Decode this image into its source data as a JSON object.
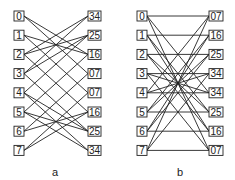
{
  "diagrams": [
    {
      "id": "a",
      "caption": "a",
      "left_labels": [
        "0",
        "1",
        "2",
        "3",
        "4",
        "5",
        "6",
        "7"
      ],
      "right_labels": [
        "34",
        "25",
        "16",
        "07",
        "07",
        "16",
        "25",
        "34"
      ],
      "connections": [
        [
          0,
          2
        ],
        [
          0,
          3
        ],
        [
          1,
          2
        ],
        [
          1,
          4
        ],
        [
          2,
          0
        ],
        [
          2,
          1
        ],
        [
          2,
          5
        ],
        [
          3,
          0
        ],
        [
          3,
          1
        ],
        [
          3,
          6
        ],
        [
          4,
          6
        ],
        [
          4,
          7
        ],
        [
          4,
          1
        ],
        [
          5,
          6
        ],
        [
          5,
          7
        ],
        [
          5,
          2
        ],
        [
          6,
          3
        ],
        [
          6,
          5
        ],
        [
          7,
          5
        ],
        [
          7,
          4
        ]
      ]
    },
    {
      "id": "b",
      "caption": "b",
      "left_labels": [
        "0",
        "1",
        "2",
        "3",
        "4",
        "5",
        "6",
        "7"
      ],
      "right_labels": [
        "07",
        "16",
        "25",
        "34",
        "34",
        "25",
        "16",
        "07"
      ],
      "connections": [
        [
          0,
          0
        ],
        [
          1,
          1
        ],
        [
          2,
          2
        ],
        [
          3,
          3
        ],
        [
          4,
          4
        ],
        [
          5,
          5
        ],
        [
          6,
          6
        ],
        [
          7,
          7
        ],
        [
          0,
          7
        ],
        [
          1,
          6
        ],
        [
          2,
          5
        ],
        [
          3,
          4
        ],
        [
          4,
          3
        ],
        [
          5,
          2
        ],
        [
          6,
          1
        ],
        [
          7,
          0
        ],
        [
          0,
          4
        ],
        [
          1,
          5
        ],
        [
          2,
          6
        ],
        [
          3,
          7
        ],
        [
          4,
          0
        ],
        [
          5,
          1
        ],
        [
          6,
          2
        ],
        [
          7,
          3
        ]
      ]
    }
  ]
}
